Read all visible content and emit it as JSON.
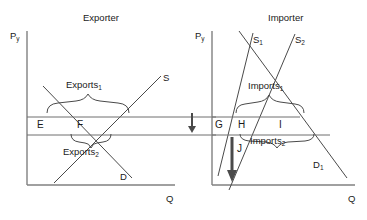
{
  "figure": {
    "type": "economics-diagram",
    "stroke_color": "#555555",
    "text_color": "#1a1a1a",
    "background": "#ffffff"
  },
  "panels": [
    {
      "id": "exporter",
      "title": "Exporter",
      "axes": {
        "y_label": "P",
        "y_label_sub": "y",
        "x_label": "Q"
      },
      "curves": [
        {
          "name": "supply",
          "label": "S",
          "label_sub": ""
        },
        {
          "name": "demand",
          "label": "D",
          "label_sub": ""
        }
      ],
      "points": [
        {
          "name": "point-e",
          "label": "E"
        },
        {
          "name": "point-f",
          "label": "F"
        }
      ],
      "braces": [
        {
          "name": "exports-1",
          "label": "Exports",
          "label_sub": "1",
          "orientation": "down"
        },
        {
          "name": "exports-2",
          "label": "Exports",
          "label_sub": "2",
          "orientation": "up"
        }
      ]
    },
    {
      "id": "importer",
      "title": "Importer",
      "axes": {
        "y_label": "P",
        "y_label_sub": "y",
        "x_label": "Q"
      },
      "curves": [
        {
          "name": "supply-1",
          "label": "S",
          "label_sub": "1"
        },
        {
          "name": "supply-2",
          "label": "S",
          "label_sub": "2"
        },
        {
          "name": "demand-1",
          "label": "D",
          "label_sub": "1"
        }
      ],
      "points": [
        {
          "name": "point-g",
          "label": "G"
        },
        {
          "name": "point-h",
          "label": "H"
        },
        {
          "name": "point-i",
          "label": "I"
        },
        {
          "name": "point-j",
          "label": "J"
        }
      ],
      "braces": [
        {
          "name": "imports-1",
          "label": "Imports",
          "label_sub": "1",
          "orientation": "down"
        },
        {
          "name": "imports-2",
          "label": "Imports",
          "label_sub": "2",
          "orientation": "up"
        }
      ]
    }
  ],
  "annotations": [
    {
      "name": "price-transfer-arrow",
      "type": "down-arrow",
      "description": "arrow between panels at price line level"
    },
    {
      "name": "quantity-shift-arrow",
      "type": "down-arrow",
      "description": "thick vertical arrow labelled J in importer panel"
    }
  ]
}
